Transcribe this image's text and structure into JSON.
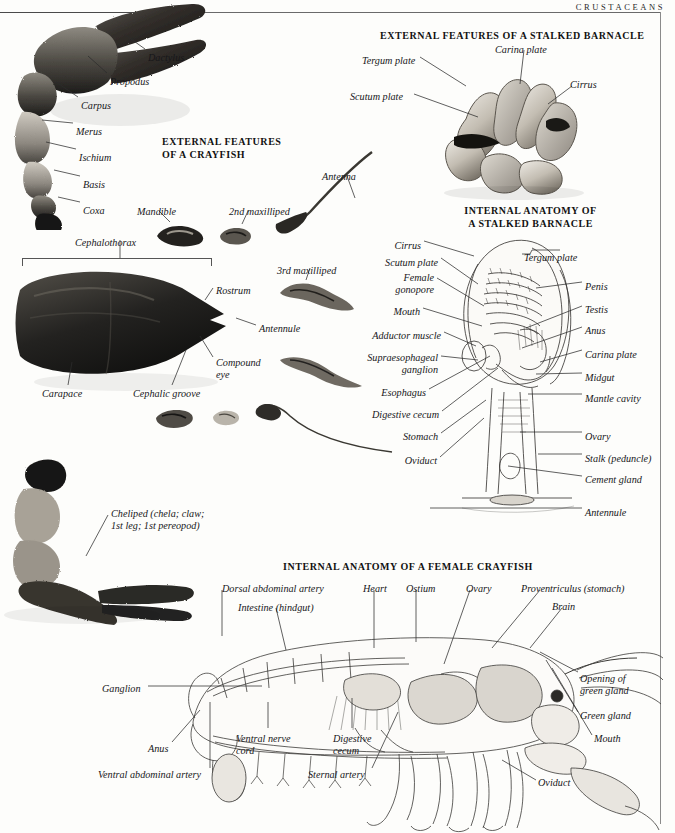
{
  "running_head": "CRUSTACEANS",
  "sections": {
    "barnacle_external": {
      "title": "EXTERNAL FEATURES OF A STALKED BARNACLE",
      "labels": [
        {
          "text": "Tergum plate",
          "x": 362,
          "y": 55,
          "align": "left"
        },
        {
          "text": "Carina plate",
          "x": 495,
          "y": 44,
          "align": "left"
        },
        {
          "text": "Cirrus",
          "x": 570,
          "y": 79,
          "align": "left"
        },
        {
          "text": "Scutum plate",
          "x": 350,
          "y": 91,
          "align": "left"
        }
      ]
    },
    "crayfish_external": {
      "title": "EXTERNAL FEATURES\nOF A CRAYFISH",
      "labels": [
        {
          "text": "Dactylus",
          "x": 148,
          "y": 52,
          "align": "left"
        },
        {
          "text": "Propodus",
          "x": 110,
          "y": 76,
          "align": "left"
        },
        {
          "text": "Carpus",
          "x": 81,
          "y": 100,
          "align": "left"
        },
        {
          "text": "Merus",
          "x": 76,
          "y": 126,
          "align": "left"
        },
        {
          "text": "Ischium",
          "x": 79,
          "y": 152,
          "align": "left"
        },
        {
          "text": "Basis",
          "x": 83,
          "y": 179,
          "align": "left"
        },
        {
          "text": "Coxa",
          "x": 83,
          "y": 205,
          "align": "left"
        },
        {
          "text": "Cephalothorax",
          "x": 75,
          "y": 237,
          "align": "left"
        },
        {
          "text": "Mandible",
          "x": 137,
          "y": 206,
          "align": "left"
        },
        {
          "text": "2nd maxilliped",
          "x": 229,
          "y": 206,
          "align": "left"
        },
        {
          "text": "Antenna",
          "x": 322,
          "y": 171,
          "align": "left"
        },
        {
          "text": "3rd maxilliped",
          "x": 277,
          "y": 265,
          "align": "left"
        },
        {
          "text": "Rostrum",
          "x": 216,
          "y": 285,
          "align": "left"
        },
        {
          "text": "Antennule",
          "x": 259,
          "y": 323,
          "align": "left"
        },
        {
          "text": "Compound\neye",
          "x": 216,
          "y": 357,
          "align": "left"
        },
        {
          "text": "Carapace",
          "x": 42,
          "y": 388,
          "align": "left"
        },
        {
          "text": "Cephalic groove",
          "x": 133,
          "y": 388,
          "align": "left"
        },
        {
          "text": "Cheliped (chela; claw;\n1st leg; 1st pereopod)",
          "x": 111,
          "y": 508,
          "align": "left"
        }
      ]
    },
    "barnacle_internal": {
      "title": "INTERNAL ANATOMY OF\nA STALKED BARNACLE",
      "labels_left": [
        {
          "text": "Cirrus",
          "x": 421,
          "y": 240,
          "align": "right"
        },
        {
          "text": "Scutum plate",
          "x": 438,
          "y": 257,
          "align": "right"
        },
        {
          "text": "Female\ngonopore",
          "x": 434,
          "y": 272,
          "align": "right"
        },
        {
          "text": "Mouth",
          "x": 420,
          "y": 306,
          "align": "right"
        },
        {
          "text": "Adductor muscle",
          "x": 441,
          "y": 330,
          "align": "right"
        },
        {
          "text": "Supraesophageal\nganglion",
          "x": 438,
          "y": 352,
          "align": "right"
        },
        {
          "text": "Esophagus",
          "x": 426,
          "y": 387,
          "align": "right"
        },
        {
          "text": "Digestive cecum",
          "x": 439,
          "y": 409,
          "align": "right"
        },
        {
          "text": "Stomach",
          "x": 438,
          "y": 431,
          "align": "right"
        },
        {
          "text": "Oviduct",
          "x": 437,
          "y": 455,
          "align": "right"
        }
      ],
      "labels_right": [
        {
          "text": "Tergum plate",
          "x": 524,
          "y": 252,
          "align": "left"
        },
        {
          "text": "Penis",
          "x": 585,
          "y": 281,
          "align": "left"
        },
        {
          "text": "Testis",
          "x": 585,
          "y": 304,
          "align": "left"
        },
        {
          "text": "Anus",
          "x": 585,
          "y": 325,
          "align": "left"
        },
        {
          "text": "Carina plate",
          "x": 585,
          "y": 349,
          "align": "left"
        },
        {
          "text": "Midgut",
          "x": 585,
          "y": 372,
          "align": "left"
        },
        {
          "text": "Mantle cavity",
          "x": 585,
          "y": 393,
          "align": "left"
        },
        {
          "text": "Ovary",
          "x": 585,
          "y": 431,
          "align": "left"
        },
        {
          "text": "Stalk (peduncle)",
          "x": 585,
          "y": 453,
          "align": "left"
        },
        {
          "text": "Cement gland",
          "x": 585,
          "y": 474,
          "align": "left"
        },
        {
          "text": "Antennule",
          "x": 585,
          "y": 507,
          "align": "left"
        }
      ]
    },
    "crayfish_internal": {
      "title": "INTERNAL ANATOMY OF A FEMALE CRAYFISH",
      "labels": [
        {
          "text": "Dorsal abdominal artery",
          "x": 222,
          "y": 583,
          "align": "left"
        },
        {
          "text": "Intestine (hindgut)",
          "x": 238,
          "y": 602,
          "align": "left"
        },
        {
          "text": "Heart",
          "x": 363,
          "y": 583,
          "align": "left"
        },
        {
          "text": "Ostium",
          "x": 406,
          "y": 583,
          "align": "left"
        },
        {
          "text": "Ovary",
          "x": 466,
          "y": 583,
          "align": "left"
        },
        {
          "text": "Proventriculus (stomach)",
          "x": 521,
          "y": 583,
          "align": "left"
        },
        {
          "text": "Brain",
          "x": 552,
          "y": 601,
          "align": "left"
        },
        {
          "text": "Opening of\ngreen gland",
          "x": 580,
          "y": 673,
          "align": "left"
        },
        {
          "text": "Green gland",
          "x": 580,
          "y": 710,
          "align": "left"
        },
        {
          "text": "Mouth",
          "x": 594,
          "y": 733,
          "align": "left"
        },
        {
          "text": "Oviduct",
          "x": 538,
          "y": 777,
          "align": "left"
        },
        {
          "text": "Ganglion",
          "x": 102,
          "y": 683,
          "align": "left"
        },
        {
          "text": "Anus",
          "x": 148,
          "y": 743,
          "align": "left"
        },
        {
          "text": "Ventral abdominal artery",
          "x": 98,
          "y": 769,
          "align": "left"
        },
        {
          "text": "Ventral nerve\ncord",
          "x": 236,
          "y": 733,
          "align": "left"
        },
        {
          "text": "Digestive\ncecum",
          "x": 333,
          "y": 733,
          "align": "left"
        },
        {
          "text": "Sternal artery",
          "x": 308,
          "y": 769,
          "align": "left"
        }
      ]
    }
  },
  "colors": {
    "ink": "#17171a",
    "rule": "#6a6a6a",
    "paper": "#fdfdfb",
    "specimen_dark": "#1b1a18",
    "specimen_mid": "#6e6a63",
    "drawing_line": "#3a3a3a"
  }
}
